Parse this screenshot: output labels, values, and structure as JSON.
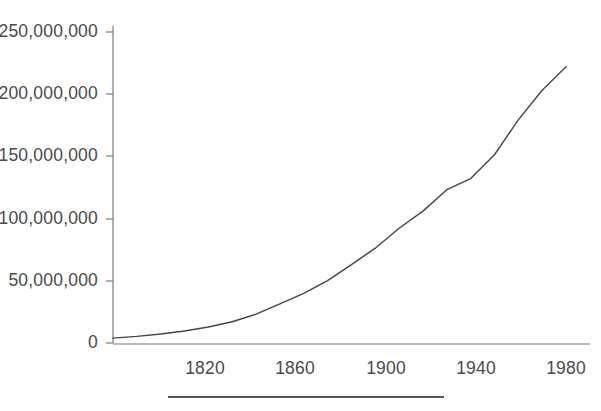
{
  "figure": {
    "background_color": "#ffffff",
    "line_color": "#444444",
    "axis_color": "#7a7a7a",
    "text_color": "#4a4a4a",
    "rule_color": "#555555"
  },
  "chart_data": {
    "type": "line",
    "title": "",
    "subtitle": "",
    "xlabel": "",
    "ylabel": "",
    "grid": false,
    "legend": null,
    "legend_position": "none",
    "xlim": [
      1790,
      1980
    ],
    "ylim": [
      0,
      250000000
    ],
    "xticks": [
      1820,
      1860,
      1900,
      1940,
      1980
    ],
    "xtick_labels": [
      "1820",
      "1860",
      "1900",
      "1940",
      "1980"
    ],
    "yticks": [
      0,
      50000000,
      100000000,
      150000000,
      200000000,
      250000000
    ],
    "ytick_labels": [
      "0",
      "50,000,000",
      "100,000,000",
      "150,000,000",
      "200,000,000",
      "250,000,000"
    ],
    "series": [
      {
        "name": "Population",
        "x": [
          1790,
          1800,
          1810,
          1820,
          1830,
          1840,
          1850,
          1860,
          1870,
          1880,
          1890,
          1900,
          1910,
          1920,
          1930,
          1940,
          1950,
          1960,
          1970,
          1980
        ],
        "values": [
          3929214,
          5308483,
          7239881,
          9638453,
          12866020,
          17069453,
          23191876,
          31443321,
          39818449,
          50189209,
          62979766,
          76212168,
          92228496,
          106021537,
          123202624,
          132164569,
          151325798,
          179323175,
          203211926,
          222000000
        ]
      }
    ],
    "annotations": []
  },
  "caption_rule": {
    "label": "horizontal-rule"
  }
}
